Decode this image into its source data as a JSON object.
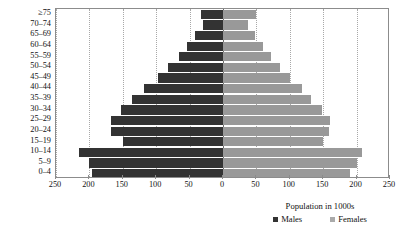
{
  "chart_data": {
    "type": "bar",
    "subtype": "population-pyramid",
    "title": "",
    "xlabel": "",
    "ylabel": "",
    "legend_title": "Population in 1000s",
    "legend_position": "bottom-right",
    "grid": true,
    "orientation": "horizontal",
    "xlim": [
      -250,
      250
    ],
    "x_ticks": [
      -250,
      -200,
      -150,
      -100,
      -50,
      0,
      50,
      100,
      150,
      200,
      250
    ],
    "x_tick_labels": [
      "250",
      "200",
      "150",
      "100",
      "50",
      "0",
      "50",
      "100",
      "150",
      "200",
      "250"
    ],
    "categories": [
      "≥75",
      "70–74",
      "65–69",
      "60–64",
      "55–59",
      "50–54",
      "45–49",
      "40–44",
      "35–39",
      "30–34",
      "25–29",
      "20–24",
      "15–19",
      "10–14",
      "5–9",
      "0–4"
    ],
    "series": [
      {
        "name": "Males",
        "color": "#333333",
        "side": "left",
        "values": [
          33,
          30,
          42,
          54,
          66,
          82,
          98,
          118,
          136,
          152,
          168,
          168,
          150,
          215,
          200,
          196
        ]
      },
      {
        "name": "Females",
        "color": "#999999",
        "side": "right",
        "values": [
          49,
          38,
          48,
          60,
          72,
          86,
          100,
          118,
          132,
          148,
          160,
          158,
          150,
          208,
          200,
          190
        ]
      }
    ]
  },
  "legend": {
    "title": "Population in 1000s",
    "entries": [
      {
        "label": "Males",
        "color": "#333333"
      },
      {
        "label": "Females",
        "color": "#aaaaaa"
      }
    ]
  },
  "colors": {
    "male_bar": "#333333",
    "female_bar": "#999999",
    "axis": "#8c8c8c",
    "gridline": "#a8a8a8",
    "zero_line": "#6e6e6e",
    "text": "#111111",
    "background": "#ffffff"
  }
}
